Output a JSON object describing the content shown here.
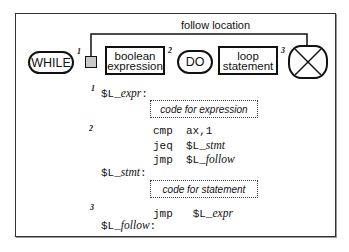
{
  "diagram": {
    "follow_label": "follow location",
    "nodes": {
      "while": "WHILE",
      "boolean_line1": "boolean",
      "boolean_line2": "expression",
      "do": "DO",
      "loop_line1": "loop",
      "loop_line2": "statement"
    },
    "markers": {
      "m1": "1",
      "m2": "2",
      "m3": "3"
    },
    "end_symbol": "end-x-icon",
    "colors": {
      "square_fill": "#c8c8c8",
      "line": "#111111",
      "frame": "#333333"
    }
  },
  "code": {
    "step1": "1",
    "label_expr_prefix": "$L_",
    "label_expr_name": "expr",
    "label_expr_colon": ":",
    "expr_box": "code for expression",
    "step2": "2",
    "line_cmp_op": "cmp",
    "line_cmp_arg": "ax,1",
    "line_jeq_op": "jeq",
    "line_jeq_prefix": "$L_",
    "line_jeq_name": "stmt",
    "line_jmp1_op": "jmp",
    "line_jmp1_prefix": "$L_",
    "line_jmp1_name": "follow",
    "label_stmt_prefix": "$L_",
    "label_stmt_name": "stmt",
    "label_stmt_colon": ":",
    "stmt_box": "code for statement",
    "step3": "3",
    "line_jmp2_op": "jmp",
    "line_jmp2_prefix": "$L_",
    "line_jmp2_name": "expr",
    "label_follow_prefix": "$L_",
    "label_follow_name": "follow",
    "label_follow_colon": ":"
  }
}
